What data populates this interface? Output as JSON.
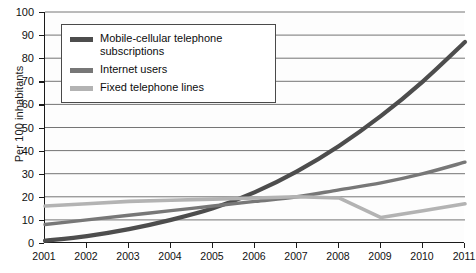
{
  "chart_data": {
    "type": "line",
    "title": "",
    "xlabel": "",
    "ylabel": "Per 100 inhabitants",
    "x": [
      2001,
      2002,
      2003,
      2004,
      2005,
      2006,
      2007,
      2008,
      2009,
      2010,
      2011
    ],
    "xtick_labels": [
      "2001",
      "2002",
      "2003",
      "2004",
      "2005",
      "2006",
      "2007",
      "2008",
      "2009",
      "2010",
      "2011"
    ],
    "ylim": [
      0,
      100
    ],
    "ytick_labels": [
      "0",
      "10",
      "20",
      "30",
      "40",
      "50",
      "60",
      "70",
      "80",
      "90",
      "100"
    ],
    "yticks": [
      0,
      10,
      20,
      30,
      40,
      50,
      60,
      70,
      80,
      90,
      100
    ],
    "grid": true,
    "grid_axis": "y",
    "legend_position": "upper-left-inside",
    "series": [
      {
        "name": "Mobile-cellular telephone subscriptions",
        "color": "#4d4d4d",
        "values": [
          1,
          3,
          6,
          10,
          15,
          22,
          31,
          42,
          55,
          70,
          87
        ]
      },
      {
        "name": "Internet users",
        "color": "#777777",
        "values": [
          8,
          10,
          12,
          14,
          16,
          18,
          20,
          23,
          26,
          30,
          35
        ]
      },
      {
        "name": "Fixed telephone lines",
        "color": "#b3b3b3",
        "values": [
          16,
          17,
          18,
          18.5,
          19,
          19.5,
          20,
          19.5,
          11,
          14,
          17
        ]
      }
    ]
  },
  "legend": {
    "items": [
      {
        "label": "Mobile-cellular telephone subscriptions",
        "color": "#4d4d4d"
      },
      {
        "label": "Internet users",
        "color": "#777777"
      },
      {
        "label": "Fixed telephone lines",
        "color": "#b3b3b3"
      }
    ]
  },
  "axes": {
    "y_title": "Per 100 inhabitants"
  }
}
